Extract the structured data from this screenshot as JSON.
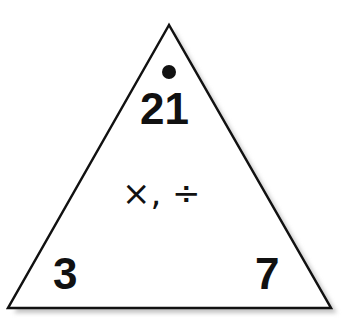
{
  "triangle": {
    "top": "21",
    "bottom_left": "3",
    "bottom_right": "7",
    "operations": "×, ÷",
    "stroke_color": "#111111",
    "shadow_color": "#bdbdbd"
  }
}
